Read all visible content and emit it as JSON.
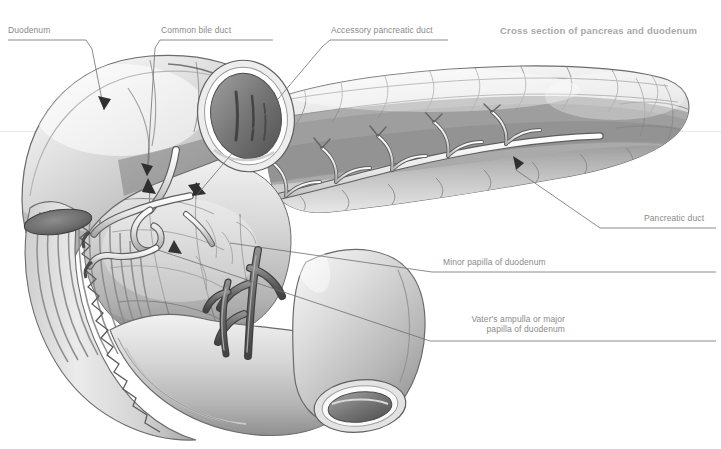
{
  "title": "Cross section of pancreas and duodenum",
  "background": "#ffffff",
  "text_color": "#8a8a8a",
  "title_color": "#a8a8a8",
  "leader_color": "#6f6f6f",
  "labels": {
    "duodenum": "Duodenum",
    "common_bile_duct": "Common bile duct",
    "accessory_pancreatic_duct": "Accessory pancreatic duct",
    "pancreatic_duct": "Pancreatic duct",
    "minor_papilla": "Minor papilla of duodenum",
    "vater_ampulla_line1": "Vater's ampulla or major",
    "vater_ampulla_line2": "papilla of duodenum"
  }
}
